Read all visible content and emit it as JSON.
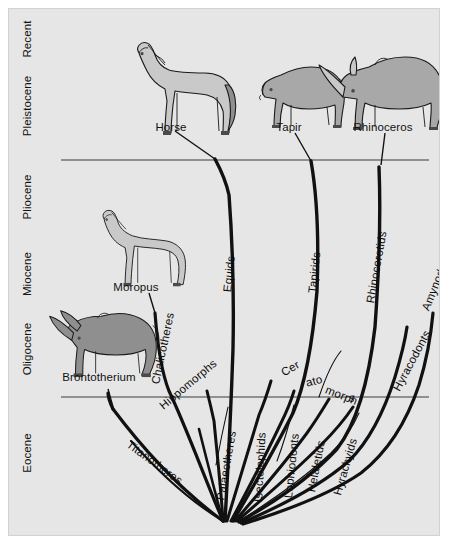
{
  "figure": {
    "background_color": "#e6e6e6",
    "frame_color": "#d2d2d2"
  },
  "axis": {
    "name": "geologic-epochs",
    "orientation": "vertical",
    "direction": "oldest-at-bottom",
    "labels": [
      {
        "id": "recent",
        "text": "Recent",
        "center_y": 38
      },
      {
        "id": "pleistocene",
        "text": "Pleistocene",
        "center_y": 105
      },
      {
        "id": "pliocene",
        "text": "Pliocene",
        "center_y": 196
      },
      {
        "id": "miocene",
        "text": "Miocene",
        "center_y": 273
      },
      {
        "id": "oligocene",
        "text": "Oligocene",
        "center_y": 348
      },
      {
        "id": "eocene",
        "text": "Eocene",
        "center_y": 452
      }
    ]
  },
  "divider_lines": [
    {
      "id": "pliocene-pleistocene-boundary",
      "y": 159,
      "x1": 60,
      "x2": 428
    },
    {
      "id": "eocene-oligocene-boundary",
      "y": 396,
      "x1": 60,
      "x2": 428
    }
  ],
  "animals": [
    {
      "id": "horse",
      "label": "Horse",
      "label_x": 170,
      "label_y": 127,
      "tone": "light"
    },
    {
      "id": "tapir",
      "label": "Tapir",
      "label_x": 288,
      "label_y": 127,
      "tone": "mid"
    },
    {
      "id": "rhinoceros",
      "label": "Rhinoceros",
      "label_x": 382,
      "label_y": 127,
      "tone": "mid"
    },
    {
      "id": "moropus",
      "label": "Moropus",
      "label_x": 135,
      "label_y": 287,
      "tone": "light"
    },
    {
      "id": "brontotherium",
      "label": "Brontotherium",
      "label_x": 98,
      "label_y": 377,
      "tone": "dark"
    }
  ],
  "clades": [
    {
      "id": "chalicotheres",
      "text": "Chalicotheres",
      "x": 154,
      "y": 384,
      "rotation": -78
    },
    {
      "id": "equids",
      "text": "Equids",
      "x": 226,
      "y": 292,
      "rotation": -84
    },
    {
      "id": "tapirids",
      "text": "Tapirids",
      "x": 311,
      "y": 293,
      "rotation": -84
    },
    {
      "id": "rhinocerotids",
      "text": "Rhinocerotids",
      "x": 369,
      "y": 303,
      "rotation": -80
    },
    {
      "id": "amynodonts",
      "text": "Amynodonts",
      "x": 424,
      "y": 310,
      "rotation": -68
    },
    {
      "id": "hyracodonts",
      "text": "Hyracodonts",
      "x": 395,
      "y": 390,
      "rotation": -62
    },
    {
      "id": "hippomorphs",
      "text": "Hippomorphs",
      "x": 160,
      "y": 407,
      "rotation": -40
    },
    {
      "id": "palaeotheres",
      "text": "Palaeotheres",
      "x": 219,
      "y": 500,
      "rotation": -80
    },
    {
      "id": "isectolophids",
      "text": "Isectolophids",
      "x": 257,
      "y": 502,
      "rotation": -87
    },
    {
      "id": "lophiodonts",
      "text": "Lophiodonts",
      "x": 287,
      "y": 498,
      "rotation": -84
    },
    {
      "id": "helaletids",
      "text": "Helaletids",
      "x": 310,
      "y": 492,
      "rotation": -79
    },
    {
      "id": "hyrachyids",
      "text": "Hyrachyids",
      "x": 336,
      "y": 495,
      "rotation": -74
    },
    {
      "id": "titanotheres",
      "text": "Titanotheres",
      "x": 127,
      "y": 443,
      "rotation": 36
    }
  ],
  "clade_fragments": [
    {
      "id": "ceratomorphs-cer",
      "text": "Cer",
      "x": 281,
      "y": 373,
      "rotation": -30
    },
    {
      "id": "ceratomorphs-ato",
      "text": "ato",
      "x": 305,
      "y": 383,
      "rotation": -15
    },
    {
      "id": "ceratomorphs-morph",
      "text": "morph",
      "x": 325,
      "y": 389,
      "rotation": 22
    },
    {
      "id": "ceratomorphs-s",
      "text": "s",
      "x": 348,
      "y": 397,
      "rotation": 12
    }
  ]
}
